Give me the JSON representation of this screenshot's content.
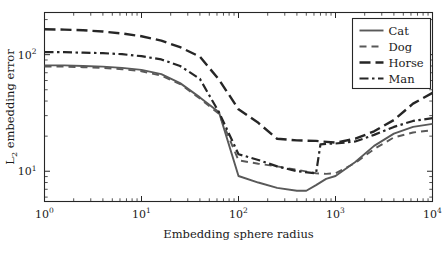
{
  "chart_data": {
    "type": "line",
    "title": "",
    "xlabel": "Embedding sphere radius",
    "ylabel": "L2 embedding error",
    "ylabel_parts": {
      "main": "L",
      "sub": "2",
      "rest": " embedding error"
    },
    "xscale": "log",
    "yscale": "log",
    "xlim": [
      1,
      10000
    ],
    "ylim": [
      5.5,
      230
    ],
    "grid": false,
    "legend_position": "top-right",
    "x_tick_labels": [
      "10^0",
      "10^1",
      "10^2",
      "10^3",
      "10^4"
    ],
    "x_tick_bases": [
      "10",
      "10",
      "10",
      "10",
      "10"
    ],
    "x_tick_exponents": [
      "0",
      "1",
      "2",
      "3",
      "4"
    ],
    "x_tick_values": [
      1,
      10,
      100,
      1000,
      10000
    ],
    "y_tick_labels": [
      "10^1",
      "10^2"
    ],
    "y_tick_bases": [
      "10",
      "10"
    ],
    "y_tick_exponents": [
      "1",
      "2"
    ],
    "y_tick_values": [
      10,
      100
    ],
    "series": [
      {
        "name": "Cat",
        "style": "solid",
        "color": "#595959",
        "x": [
          1,
          1.6,
          2.5,
          4,
          6.3,
          10,
          16,
          25,
          40,
          63,
          100,
          160,
          250,
          400,
          500,
          630,
          800,
          1000,
          1600,
          2500,
          4000,
          6300,
          10000
        ],
        "y": [
          81,
          81,
          80,
          79,
          77,
          74,
          68,
          57,
          43,
          32,
          9.1,
          8.0,
          7.2,
          6.8,
          6.8,
          7.6,
          8.6,
          9.1,
          12.0,
          16.5,
          21.0,
          24.0,
          25.5
        ]
      },
      {
        "name": "Dog",
        "style": "dashed",
        "color": "#595959",
        "x": [
          1,
          1.6,
          2.5,
          4,
          6.3,
          10,
          16,
          25,
          40,
          63,
          100,
          160,
          250,
          400,
          630,
          800,
          1000,
          1600,
          2500,
          4000,
          6300,
          10000
        ],
        "y": [
          79,
          79,
          78,
          77,
          75,
          72,
          66,
          56,
          42,
          31,
          12.4,
          11.6,
          11.0,
          10.3,
          9.6,
          9.5,
          9.6,
          11.8,
          15.5,
          19.5,
          21.5,
          22.5
        ]
      },
      {
        "name": "Horse",
        "style": "longdash",
        "color": "#262626",
        "x": [
          1,
          1.6,
          2.5,
          4,
          6.3,
          10,
          16,
          25,
          40,
          63,
          100,
          160,
          250,
          400,
          630,
          1000,
          1600,
          2500,
          4000,
          6300,
          10000
        ],
        "y": [
          165,
          164,
          162,
          158,
          152,
          144,
          132,
          116,
          96,
          61,
          34,
          26,
          19.0,
          18.4,
          18.2,
          17.6,
          19.0,
          22.0,
          27.5,
          38.0,
          47.0
        ]
      },
      {
        "name": "Man",
        "style": "dashdot",
        "color": "#262626",
        "x": [
          1,
          1.6,
          2.5,
          4,
          6.3,
          10,
          16,
          25,
          40,
          63,
          100,
          160,
          250,
          400,
          630,
          700,
          800,
          1000,
          1600,
          2500,
          4000,
          6300,
          10000
        ],
        "y": [
          105,
          105,
          104,
          103,
          101,
          97,
          91,
          80,
          62,
          32,
          14.0,
          12.5,
          11.0,
          10.0,
          9.6,
          17.0,
          17.2,
          17.3,
          18.0,
          20.5,
          24.0,
          27.0,
          28.5
        ]
      }
    ],
    "legend_entries": [
      {
        "label": "Cat",
        "style": "solid",
        "color": "#595959"
      },
      {
        "label": "Dog",
        "style": "dashed",
        "color": "#595959"
      },
      {
        "label": "Horse",
        "style": "longdash",
        "color": "#262626"
      },
      {
        "label": "Man",
        "style": "dashdot",
        "color": "#262626"
      }
    ]
  }
}
